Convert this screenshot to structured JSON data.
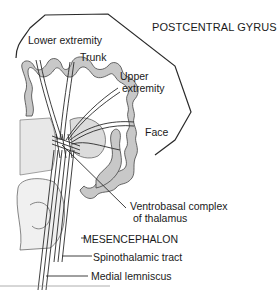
{
  "diagram": {
    "type": "neuroanatomy-pathway",
    "colors": {
      "background": "#ffffff",
      "outline": "#2a2a2a",
      "cortex_fill": "#c8c8c8",
      "text": "#1a1a1a"
    },
    "labels": {
      "postcentral_gyrus": "POSTCENTRAL GYRUS",
      "lower_extremity": "Lower extremity",
      "trunk": "Trunk",
      "upper_extremity_line1": "Upper",
      "upper_extremity_line2": "extremity",
      "face": "Face",
      "ventrobasal_line1": "Ventrobasal complex",
      "ventrobasal_line2": "of thalamus",
      "mesencephalon": "MESENCEPHALON",
      "spinothalamic_tract": "Spinothalamic tract",
      "medial_lemniscus": "Medial lemniscus"
    }
  }
}
